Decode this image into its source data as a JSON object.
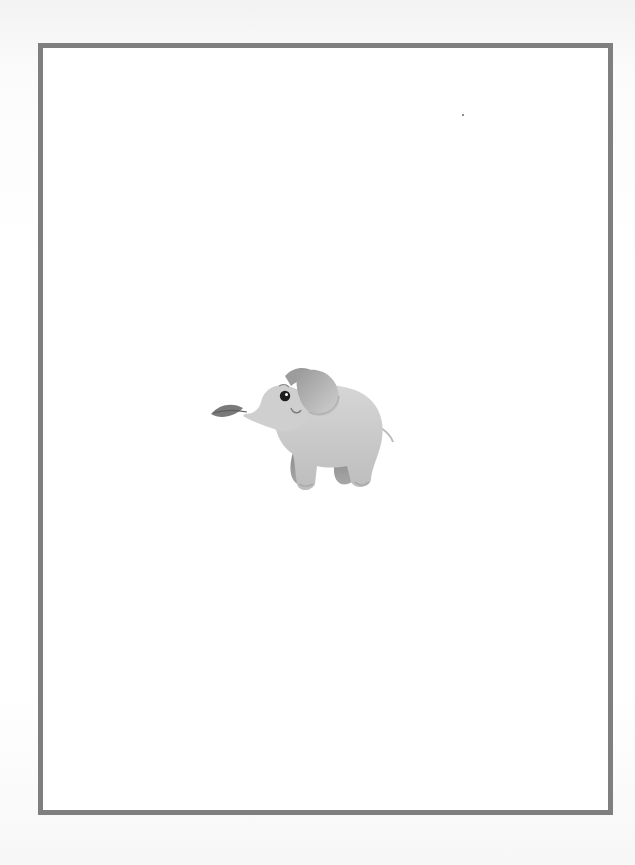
{
  "page": {
    "type": "coloring-page-frame",
    "colors": {
      "frame_border": "#7f7f7f",
      "background": "#ffffff",
      "elephant_body": "#c9c9c9",
      "elephant_shadow": "#8f8f8f",
      "leaf": "#777777"
    }
  },
  "illustration": {
    "subject": "baby-elephant-icon",
    "holding": "leaf-icon"
  }
}
